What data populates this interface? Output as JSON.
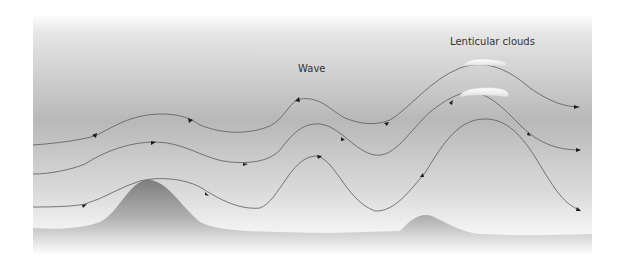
{
  "labels": {
    "wave": "Wave",
    "lenticular": "Lenticular clouds"
  },
  "colors": {
    "sky_top": "#ffffff",
    "sky_mid": "#b4b4b4",
    "sky_bottom": "#ffffff",
    "ground_top": "#8a8a8a",
    "ground_bottom": "#ffffff",
    "streamline": "#5a5a5a",
    "arrow": "#1a1a1a",
    "cloud": "#ffffff"
  },
  "diagram": {
    "elements": [
      "sky",
      "mountain",
      "small hill",
      "three streamlines with arrows",
      "two lenticular clouds"
    ]
  }
}
